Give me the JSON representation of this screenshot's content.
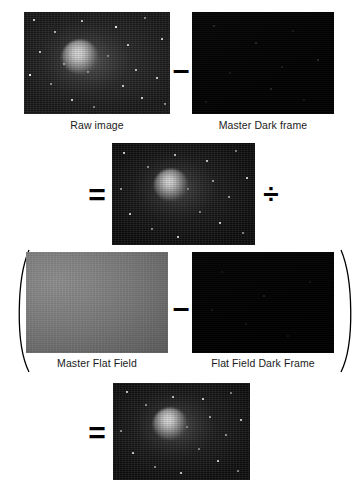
{
  "figure": {
    "type": "astronomical-image-calibration-equation",
    "background_color": "#ffffff",
    "text_color": "#1a1a1a"
  },
  "panels": {
    "raw_image": {
      "caption": "Raw image",
      "kind": "light-frame",
      "description": "noisy star field with bright galaxy core"
    },
    "master_dark": {
      "caption": "Master Dark frame",
      "kind": "dark-frame",
      "description": "near black frame with sparse hot pixels"
    },
    "calibrated_numerator": {
      "caption": "",
      "kind": "light-minus-dark",
      "description": "dark subtracted star field with galaxy"
    },
    "master_flat": {
      "caption": "Master Flat Field",
      "kind": "flat-frame",
      "description": "smooth grey illumination gradient"
    },
    "flat_dark": {
      "caption": "Flat Field Dark Frame",
      "kind": "flat-dark-frame",
      "description": "near black frame"
    },
    "final_result": {
      "caption": "",
      "kind": "calibrated-result",
      "description": "final calibrated image of the galaxy"
    }
  },
  "operators": {
    "minus_top": "–",
    "equals_middle": "=",
    "divide": "÷",
    "minus_bottom": "–",
    "equals_bottom": "=",
    "paren_open": "(",
    "paren_close": ")"
  }
}
